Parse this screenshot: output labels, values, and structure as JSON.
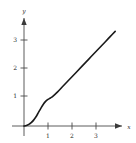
{
  "chart_data": {
    "type": "line",
    "title": "",
    "subtitle": "",
    "xlabel": "x",
    "ylabel": "y",
    "xlim": [
      -0.35,
      4.2
    ],
    "ylim": [
      -0.3,
      3.9
    ],
    "grid": false,
    "legend": null,
    "x_ticks": [
      1,
      2,
      3
    ],
    "y_ticks": [
      1,
      2,
      3
    ],
    "x_tick_labels": [
      "1",
      "2",
      "3"
    ],
    "y_tick_labels": [
      "1",
      "2",
      "3"
    ],
    "axis_arrows": [
      "x",
      "y"
    ],
    "series": [
      {
        "name": "curve",
        "color": "#1a1a1a",
        "x": [
          0.0,
          0.1,
          0.2,
          0.3,
          0.4,
          0.5,
          0.6,
          0.7,
          0.8,
          0.9,
          1.0,
          1.1,
          1.2,
          1.4,
          1.6,
          1.8,
          2.0,
          2.2,
          2.4,
          2.6,
          2.8,
          3.0,
          3.2,
          3.4,
          3.6,
          3.8
        ],
        "y": [
          0.0,
          0.02,
          0.06,
          0.12,
          0.21,
          0.33,
          0.48,
          0.63,
          0.77,
          0.88,
          0.95,
          1.0,
          1.06,
          1.22,
          1.4,
          1.58,
          1.76,
          1.94,
          2.12,
          2.3,
          2.48,
          2.66,
          2.84,
          3.02,
          3.2,
          3.38
        ]
      }
    ],
    "annotations": []
  },
  "figure": {
    "axis_color": "#4a4a4a",
    "curve_color": "#1a1a1a",
    "background": "#ffffff",
    "tick_label_color": "#2a2a2a"
  }
}
